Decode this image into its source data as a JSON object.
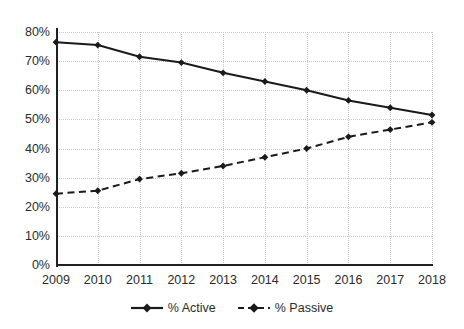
{
  "chart_data": {
    "type": "line",
    "title": "",
    "subtitle": "",
    "xlabel": "",
    "ylabel": "",
    "categories": [
      "2009",
      "2010",
      "2011",
      "2012",
      "2013",
      "2014",
      "2015",
      "2016",
      "2017",
      "2018"
    ],
    "series": [
      {
        "name": "% Active",
        "line_style": "solid",
        "marker": "diamond",
        "color": "#1a1a1a",
        "values": [
          76.5,
          75.5,
          71.5,
          69.5,
          66.0,
          63.0,
          60.0,
          56.5,
          54.0,
          51.5
        ]
      },
      {
        "name": "% Passive",
        "line_style": "dashed",
        "marker": "diamond",
        "color": "#1a1a1a",
        "values": [
          24.5,
          25.5,
          29.5,
          31.5,
          34.0,
          37.0,
          40.0,
          44.0,
          46.5,
          49.0
        ]
      }
    ],
    "ylim": [
      0,
      80
    ],
    "yticks": [
      0,
      10,
      20,
      30,
      40,
      50,
      60,
      70,
      80
    ],
    "ytick_labels": [
      "0%",
      "10%",
      "20%",
      "30%",
      "40%",
      "50%",
      "60%",
      "70%",
      "80%"
    ],
    "grid": true,
    "grid_color": "#c9c9c9",
    "legend_position": "bottom",
    "axis_color": "#231f20",
    "background": "#ffffff"
  },
  "legend": {
    "items": [
      {
        "label": "% Active"
      },
      {
        "label": "% Passive"
      }
    ]
  }
}
